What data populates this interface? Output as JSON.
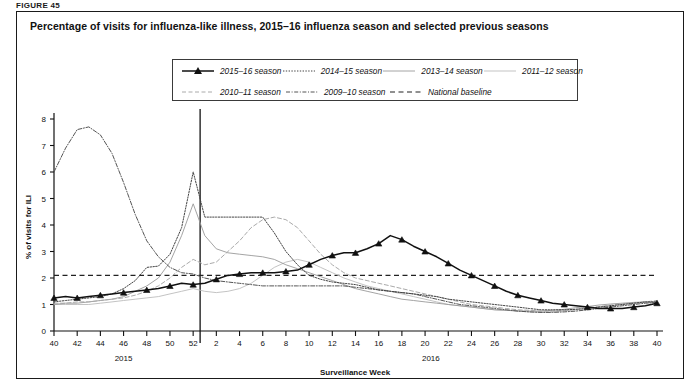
{
  "figure_label": "FIGURE 45",
  "panel": {
    "title": "Percentage of visits for influenza-like illness, 2015–16 influenza season and selected previous seasons"
  },
  "legend": {
    "position": "top-center-inside",
    "rows": [
      [
        {
          "label": "2015–16 season",
          "style": "solid-triangle",
          "color": "#111111"
        },
        {
          "label": "2014–15 season",
          "style": "fine-dotted",
          "color": "#444444"
        },
        {
          "label": "2013–14 season",
          "style": "solid-thin",
          "color": "#9a9a9a"
        },
        {
          "label": "2011–12 season",
          "style": "solid-light",
          "color": "#bcbcbc"
        }
      ],
      [
        {
          "label": "2010–11 season",
          "style": "dashed-light",
          "color": "#aaaaaa"
        },
        {
          "label": "2009–10 season",
          "style": "dash-dot",
          "color": "#555555"
        },
        {
          "label": "National baseline",
          "style": "dashed-dark",
          "color": "#222222"
        }
      ]
    ]
  },
  "chart_data": {
    "type": "line",
    "title": "Percentage of visits for influenza-like illness, 2015–16 influenza season and selected previous seasons",
    "xlabel": "Surveillance Week",
    "ylabel": "% of visits for ILI",
    "ylim": [
      0,
      8
    ],
    "yticks": [
      0,
      1,
      2,
      3,
      4,
      5,
      6,
      7,
      8
    ],
    "grid": false,
    "x_axis_note": "Surveillance weeks 40–52 of first year followed by weeks 1–40 of second year",
    "xticks": [
      40,
      42,
      44,
      46,
      48,
      50,
      52,
      2,
      4,
      6,
      8,
      10,
      12,
      14,
      16,
      18,
      20,
      22,
      24,
      26,
      28,
      30,
      32,
      34,
      36,
      38,
      40
    ],
    "year_groups": [
      {
        "label": "2015",
        "from_index": 0,
        "to_index": 12
      },
      {
        "label": "2016",
        "from_index": 13,
        "to_index": 52
      }
    ],
    "x_index_range": [
      0,
      52
    ],
    "annotations": [
      {
        "text": "National baseline",
        "type": "hline",
        "value": 2.1
      }
    ],
    "series": [
      {
        "name": "2015–16 season",
        "style": "solid-triangle",
        "color": "#111111",
        "markers_every": 2,
        "values": [
          1.25,
          1.3,
          1.25,
          1.3,
          1.35,
          1.4,
          1.45,
          1.5,
          1.55,
          1.6,
          1.7,
          1.8,
          1.75,
          1.8,
          1.95,
          2.1,
          2.15,
          2.2,
          2.2,
          2.2,
          2.25,
          2.3,
          2.5,
          2.7,
          2.85,
          2.95,
          2.95,
          3.1,
          3.3,
          3.6,
          3.45,
          3.2,
          3.0,
          2.8,
          2.55,
          2.3,
          2.1,
          1.9,
          1.7,
          1.5,
          1.35,
          1.25,
          1.15,
          1.05,
          1.0,
          0.95,
          0.9,
          0.85,
          0.85,
          0.85,
          0.9,
          0.95,
          1.05
        ]
      },
      {
        "name": "2014–15 season",
        "style": "fine-dotted",
        "color": "#444444",
        "values": [
          1.1,
          1.15,
          1.2,
          1.25,
          1.3,
          1.4,
          1.6,
          1.9,
          2.4,
          2.45,
          2.9,
          3.9,
          6.0,
          4.3,
          4.3,
          4.3,
          4.3,
          4.3,
          4.3,
          3.7,
          3.0,
          2.5,
          2.1,
          1.95,
          1.85,
          1.8,
          1.75,
          1.65,
          1.55,
          1.5,
          1.45,
          1.4,
          1.35,
          1.3,
          1.2,
          1.15,
          1.1,
          1.05,
          1.0,
          0.95,
          0.9,
          0.85,
          0.8,
          0.8,
          0.8,
          0.82,
          0.85,
          0.9,
          0.95,
          1.0,
          1.05,
          1.1,
          1.1
        ]
      },
      {
        "name": "2013–14 season",
        "style": "solid-thin",
        "color": "#9a9a9a",
        "values": [
          1.0,
          1.05,
          1.05,
          1.1,
          1.15,
          1.2,
          1.3,
          1.5,
          1.7,
          2.0,
          2.6,
          3.6,
          4.8,
          3.6,
          3.1,
          2.95,
          2.9,
          2.85,
          2.8,
          2.7,
          2.5,
          2.35,
          2.2,
          2.05,
          1.9,
          1.75,
          1.6,
          1.5,
          1.4,
          1.3,
          1.2,
          1.15,
          1.1,
          1.05,
          1.0,
          0.95,
          0.9,
          0.85,
          0.8,
          0.78,
          0.76,
          0.75,
          0.75,
          0.78,
          0.82,
          0.88,
          0.92,
          0.98,
          1.02,
          1.05,
          1.08,
          1.1,
          1.1
        ]
      },
      {
        "name": "2011–12 season",
        "style": "solid-light",
        "color": "#bcbcbc",
        "values": [
          1.0,
          1.0,
          1.0,
          1.0,
          1.05,
          1.1,
          1.15,
          1.2,
          1.25,
          1.3,
          1.4,
          1.5,
          1.6,
          1.5,
          1.45,
          1.5,
          1.6,
          1.8,
          2.1,
          2.4,
          2.6,
          2.7,
          2.6,
          2.4,
          2.2,
          2.0,
          1.85,
          1.7,
          1.6,
          1.5,
          1.4,
          1.3,
          1.2,
          1.1,
          1.0,
          0.95,
          0.9,
          0.85,
          0.8,
          0.78,
          0.75,
          0.72,
          0.7,
          0.72,
          0.76,
          0.8,
          0.85,
          0.9,
          0.95,
          1.0,
          1.05,
          1.08,
          1.1
        ]
      },
      {
        "name": "2010–11 season",
        "style": "dashed-light",
        "color": "#aaaaaa",
        "values": [
          1.05,
          1.05,
          1.1,
          1.1,
          1.15,
          1.2,
          1.25,
          1.35,
          1.5,
          1.7,
          2.0,
          2.4,
          2.7,
          2.5,
          2.6,
          3.0,
          3.4,
          3.9,
          4.2,
          4.3,
          4.2,
          3.9,
          3.4,
          2.9,
          2.5,
          2.2,
          2.0,
          1.9,
          1.8,
          1.7,
          1.6,
          1.5,
          1.4,
          1.3,
          1.2,
          1.1,
          1.0,
          0.95,
          0.9,
          0.85,
          0.8,
          0.78,
          0.75,
          0.75,
          0.78,
          0.82,
          0.88,
          0.92,
          0.98,
          1.02,
          1.05,
          1.1,
          1.15
        ]
      },
      {
        "name": "2009–10 season",
        "style": "dash-dot",
        "color": "#555555",
        "values": [
          6.0,
          6.9,
          7.6,
          7.7,
          7.4,
          6.7,
          5.6,
          4.4,
          3.4,
          2.8,
          2.4,
          2.2,
          2.15,
          2.0,
          1.9,
          1.85,
          1.8,
          1.75,
          1.7,
          1.7,
          1.7,
          1.7,
          1.7,
          1.7,
          1.7,
          1.7,
          1.65,
          1.6,
          1.55,
          1.5,
          1.45,
          1.4,
          1.3,
          1.2,
          1.1,
          1.0,
          0.95,
          0.9,
          0.85,
          0.8,
          0.75,
          0.72,
          0.7,
          0.7,
          0.72,
          0.75,
          0.8,
          0.85,
          0.9,
          0.95,
          1.0,
          1.05,
          1.08
        ]
      },
      {
        "name": "National baseline",
        "style": "dashed-dark",
        "color": "#222222",
        "constant": 2.1
      }
    ]
  }
}
